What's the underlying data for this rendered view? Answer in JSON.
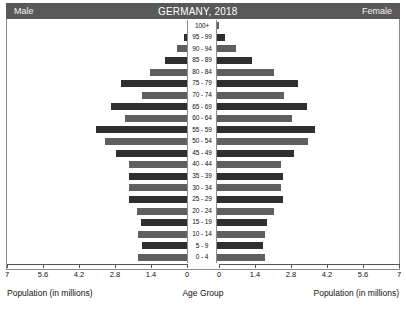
{
  "header": {
    "left_label": "Male",
    "title": "GERMANY, 2018",
    "right_label": "Female"
  },
  "axis": {
    "left_caption": "Population (in millions)",
    "center_caption": "Age Group",
    "right_caption": "Population (in millions)",
    "ticks": [
      "7",
      "5.6",
      "4.2",
      "2.8",
      "1.4",
      "0"
    ],
    "ticks_right": [
      "0",
      "1.4",
      "2.8",
      "4.2",
      "5.6",
      "7"
    ],
    "max": 7,
    "step": 1.4
  },
  "colors": {
    "header_band": "#595959",
    "bar_dark": "#2f2f2f",
    "bar_light": "#5f5f5f",
    "frame": "#8c8c8c",
    "background": "#ffffff",
    "text": "#111111"
  },
  "chart_data": {
    "type": "bar",
    "subtype": "population-pyramid",
    "title": "GERMANY, 2018",
    "xlabel": "Population (in millions)",
    "ylabel": "Age Group",
    "xlim": [
      0,
      7
    ],
    "xticks": [
      0,
      1.4,
      2.8,
      4.2,
      5.6,
      7
    ],
    "grid": false,
    "legend": [
      "Male",
      "Female"
    ],
    "legend_position": "header",
    "orientation": "horizontal",
    "categories": [
      "100+",
      "95 - 99",
      "90 - 94",
      "85 - 89",
      "80 - 84",
      "75 - 79",
      "70 - 74",
      "65 - 69",
      "60 - 64",
      "55 - 59",
      "50 - 54",
      "45 - 49",
      "40 - 44",
      "35 - 39",
      "30 - 34",
      "25 - 29",
      "20 - 24",
      "15 - 19",
      "10 - 14",
      "5 - 9",
      "0 - 4"
    ],
    "series": [
      {
        "name": "Male",
        "side": "left",
        "values": [
          0.02,
          0.12,
          0.38,
          0.85,
          1.45,
          2.55,
          1.75,
          2.95,
          2.4,
          3.55,
          3.2,
          2.75,
          2.25,
          2.25,
          2.25,
          2.25,
          1.95,
          1.8,
          1.9,
          1.75,
          1.9
        ]
      },
      {
        "name": "Female",
        "side": "right",
        "values": [
          0.06,
          0.3,
          0.75,
          1.35,
          2.2,
          3.15,
          2.6,
          3.5,
          2.9,
          3.8,
          3.55,
          3.0,
          2.5,
          2.55,
          2.5,
          2.55,
          2.2,
          1.95,
          1.85,
          1.8,
          1.85
        ]
      }
    ]
  }
}
